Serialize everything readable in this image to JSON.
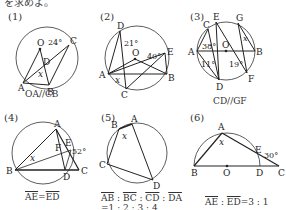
{
  "header": {
    "cropped_text": "を求めよ。"
  },
  "problems": [
    {
      "number": "(1)",
      "caption": "OA//CB",
      "points": [
        "O",
        "C",
        "D",
        "A",
        "B"
      ],
      "angles": [
        "24°",
        "x"
      ]
    },
    {
      "number": "(2)",
      "caption": "",
      "points": [
        "D",
        "O",
        "E",
        "A",
        "B",
        "C"
      ],
      "angles": [
        "21°",
        "40°",
        "x"
      ]
    },
    {
      "number": "(3)",
      "caption": "CD//GF",
      "points": [
        "C",
        "E",
        "G",
        "A",
        "O",
        "B",
        "D",
        "F"
      ],
      "angles": [
        "38°",
        "11°",
        "19°",
        "x"
      ]
    },
    {
      "number": "(4)",
      "caption_arc1": "AE",
      "caption_eq": "=",
      "caption_arc2": "ED",
      "points": [
        "A",
        "F",
        "E",
        "B",
        "D",
        "C"
      ],
      "angles": [
        "52°",
        "x"
      ]
    },
    {
      "number": "(5)",
      "caption_line1_arcs": [
        "AB",
        "BC",
        "CD",
        "DA"
      ],
      "caption_line1_sep": " : ",
      "caption_line2": "=1 : 2 : 3 : 4",
      "points": [
        "B",
        "A",
        "C",
        "D"
      ],
      "angles": [
        "x"
      ]
    },
    {
      "number": "(6)",
      "caption_arc1": "AE",
      "caption_sep": " : ",
      "caption_arc2": "ED",
      "caption_ratio": "=3 : 1",
      "points": [
        "A",
        "E",
        "B",
        "O",
        "D",
        "C"
      ],
      "angles": [
        "30°",
        "x"
      ]
    }
  ]
}
